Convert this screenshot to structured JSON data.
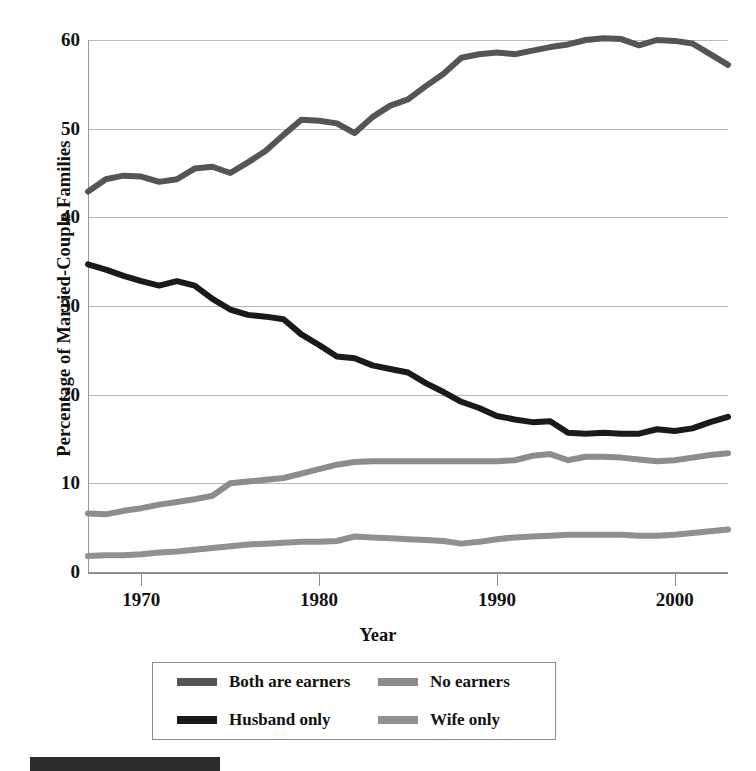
{
  "chart_data": {
    "type": "line",
    "title": "",
    "xlabel": "Year",
    "ylabel": "Percentage of Married-Couple Families",
    "xlim": [
      1967,
      2003
    ],
    "ylim": [
      0,
      60
    ],
    "ytick_labels": [
      "60",
      "50",
      "40",
      "30",
      "20",
      "10",
      "0"
    ],
    "ytick_values": [
      60,
      50,
      40,
      30,
      20,
      10,
      0
    ],
    "xtick_labels": [
      "1970",
      "1980",
      "1990",
      "2000"
    ],
    "xtick_values": [
      1970,
      1980,
      1990,
      2000
    ],
    "grid": true,
    "legend_position": "below-plot",
    "x": [
      1967,
      1968,
      1969,
      1970,
      1971,
      1972,
      1973,
      1974,
      1975,
      1976,
      1977,
      1978,
      1979,
      1980,
      1981,
      1982,
      1983,
      1984,
      1985,
      1986,
      1987,
      1988,
      1989,
      1990,
      1991,
      1992,
      1993,
      1994,
      1995,
      1996,
      1997,
      1998,
      1999,
      2000,
      2001,
      2002,
      2003
    ],
    "series": [
      {
        "name": "Both are earners",
        "color": "#555555",
        "values": [
          42.9,
          44.3,
          44.7,
          44.6,
          44.0,
          44.3,
          45.5,
          45.7,
          45.0,
          46.2,
          47.5,
          49.3,
          51.0,
          50.9,
          50.6,
          49.5,
          51.3,
          52.6,
          53.3,
          54.8,
          56.2,
          58.0,
          58.4,
          58.6,
          58.4,
          58.8,
          59.2,
          59.5,
          60.0,
          60.2,
          60.1,
          59.4,
          60.0,
          59.9,
          59.6,
          58.4,
          57.2
        ]
      },
      {
        "name": "Husband only",
        "color": "#1a1a1a",
        "values": [
          34.7,
          34.1,
          33.4,
          32.8,
          32.3,
          32.8,
          32.3,
          30.8,
          29.6,
          29.0,
          28.8,
          28.5,
          26.8,
          25.6,
          24.3,
          24.1,
          23.3,
          22.9,
          22.5,
          21.3,
          20.3,
          19.2,
          18.5,
          17.6,
          17.2,
          16.9,
          17.0,
          15.7,
          15.6,
          15.7,
          15.6,
          15.6,
          16.1,
          15.9,
          16.2,
          16.9,
          17.5
        ]
      },
      {
        "name": "No earners",
        "color": "#8c8c8c",
        "values": [
          6.6,
          6.5,
          6.9,
          7.2,
          7.6,
          7.9,
          8.2,
          8.6,
          10.0,
          10.2,
          10.4,
          10.6,
          11.1,
          11.6,
          12.1,
          12.4,
          12.5,
          12.5,
          12.5,
          12.5,
          12.5,
          12.5,
          12.5,
          12.5,
          12.6,
          13.1,
          13.3,
          12.6,
          13.0,
          13.0,
          12.9,
          12.7,
          12.5,
          12.6,
          12.9,
          13.2,
          13.4
        ]
      },
      {
        "name": "Wife only",
        "color": "#909090",
        "values": [
          1.8,
          1.9,
          1.9,
          2.0,
          2.2,
          2.3,
          2.5,
          2.7,
          2.9,
          3.1,
          3.2,
          3.3,
          3.4,
          3.4,
          3.5,
          4.0,
          3.9,
          3.8,
          3.7,
          3.6,
          3.5,
          3.2,
          3.4,
          3.7,
          3.9,
          4.0,
          4.1,
          4.2,
          4.2,
          4.2,
          4.2,
          4.1,
          4.1,
          4.2,
          4.4,
          4.6,
          4.8
        ]
      }
    ]
  },
  "legend": {
    "entries": [
      {
        "label": "Both are earners",
        "color": "#555555"
      },
      {
        "label": "No earners",
        "color": "#8c8c8c"
      },
      {
        "label": "Husband only",
        "color": "#1a1a1a"
      },
      {
        "label": "Wife only",
        "color": "#909090"
      }
    ]
  },
  "axes": {
    "y_title": "Percentage of Married-Couple Families",
    "x_title": "Year"
  }
}
